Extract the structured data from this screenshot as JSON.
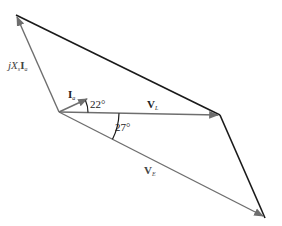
{
  "diagram": {
    "type": "phasor-diagram",
    "colors": {
      "phasor": "#6e6e6e",
      "closing_line": "#1a1a1a",
      "arc": "#1a1a1a",
      "background": "#ffffff"
    },
    "phasors": {
      "current": {
        "main": "I",
        "sub": "a"
      },
      "voltage_drop": {
        "prefix": "jX",
        "sub1": "s",
        "main": "I",
        "sub2": "a"
      },
      "load_voltage": {
        "main": "V",
        "sub": "L"
      },
      "source_voltage": {
        "main": "V",
        "sub": "E"
      }
    },
    "angles": {
      "current_angle": "22°",
      "source_voltage_angle": "27°"
    }
  }
}
